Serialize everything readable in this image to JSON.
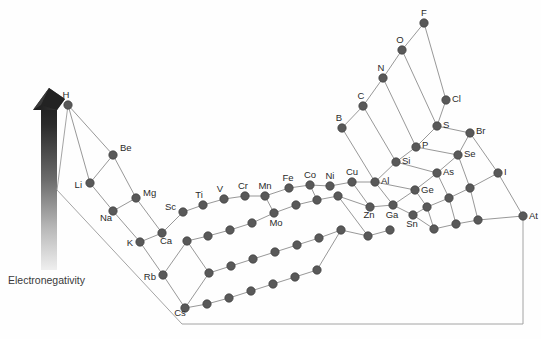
{
  "figure": {
    "axis_label": "Electronegativity",
    "arrow": {
      "name": "electronegativity-gradient-arrow",
      "direction": "up",
      "top_color": "#2a2a2a",
      "bottom_color": "#e8e8e8"
    },
    "colors": {
      "node_fill": "#595959",
      "node_stroke": "#3d3d3d",
      "edge": "#8c8c8c",
      "baseline": "#9a9a9a",
      "text": "#2b2b2b"
    }
  },
  "chart_data": {
    "type": "scatter",
    "title": "Electronegativity",
    "xlabel": "",
    "ylabel": "Electronegativity",
    "grid": false,
    "legend": false,
    "nodes": [
      {
        "label": "H",
        "x": 68,
        "y": 105,
        "lx": 66,
        "ly": 98,
        "anchor": "middle"
      },
      {
        "label": "Be",
        "x": 113,
        "y": 155,
        "lx": 120,
        "ly": 151,
        "anchor": "start"
      },
      {
        "label": "Li",
        "x": 90,
        "y": 183,
        "lx": 82,
        "ly": 188,
        "anchor": "end"
      },
      {
        "label": "Mg",
        "x": 136,
        "y": 198,
        "lx": 143,
        "ly": 196,
        "anchor": "start"
      },
      {
        "label": "Na",
        "x": 113,
        "y": 211,
        "lx": 106,
        "ly": 221,
        "anchor": "middle"
      },
      {
        "label": "Ca",
        "x": 162,
        "y": 233,
        "lx": 166,
        "ly": 244,
        "anchor": "middle"
      },
      {
        "label": "K",
        "x": 140,
        "y": 242,
        "lx": 133,
        "ly": 246,
        "anchor": "end"
      },
      {
        "label": "Rb",
        "x": 163,
        "y": 275,
        "lx": 156,
        "ly": 280,
        "anchor": "end"
      },
      {
        "label": "Cs",
        "x": 185,
        "y": 308,
        "lx": 180,
        "ly": 316,
        "anchor": "middle"
      },
      {
        "label": "Sc",
        "x": 183,
        "y": 212,
        "lx": 176,
        "ly": 210,
        "anchor": "end"
      },
      {
        "label": "Ti",
        "x": 203,
        "y": 205,
        "lx": 199,
        "ly": 198,
        "anchor": "middle"
      },
      {
        "label": "V",
        "x": 224,
        "y": 199,
        "lx": 220,
        "ly": 192,
        "anchor": "middle"
      },
      {
        "label": "Cr",
        "x": 245,
        "y": 196,
        "lx": 243,
        "ly": 189,
        "anchor": "middle"
      },
      {
        "label": "Mn",
        "x": 265,
        "y": 196,
        "lx": 265,
        "ly": 189,
        "anchor": "middle"
      },
      {
        "label": "Fe",
        "x": 289,
        "y": 188,
        "lx": 288,
        "ly": 181,
        "anchor": "middle"
      },
      {
        "label": "Co",
        "x": 310,
        "y": 185,
        "lx": 310,
        "ly": 178,
        "anchor": "middle"
      },
      {
        "label": "Ni",
        "x": 330,
        "y": 186,
        "lx": 330,
        "ly": 179,
        "anchor": "middle"
      },
      {
        "label": "Cu",
        "x": 352,
        "y": 182,
        "lx": 352,
        "ly": 175,
        "anchor": "middle"
      },
      {
        "label": "Zn",
        "x": 370,
        "y": 207,
        "lx": 369,
        "ly": 218,
        "anchor": "middle"
      },
      {
        "label": "Mo",
        "x": 274,
        "y": 213,
        "lx": 276,
        "ly": 226,
        "anchor": "middle"
      },
      {
        "label": "B",
        "x": 342,
        "y": 128,
        "lx": 339,
        "ly": 121,
        "anchor": "middle"
      },
      {
        "label": "C",
        "x": 363,
        "y": 106,
        "lx": 361,
        "ly": 99,
        "anchor": "middle"
      },
      {
        "label": "N",
        "x": 383,
        "y": 78,
        "lx": 381,
        "ly": 71,
        "anchor": "middle"
      },
      {
        "label": "O",
        "x": 402,
        "y": 50,
        "lx": 400,
        "ly": 43,
        "anchor": "middle"
      },
      {
        "label": "F",
        "x": 424,
        "y": 23,
        "lx": 424,
        "ly": 16,
        "anchor": "middle"
      },
      {
        "label": "Al",
        "x": 375,
        "y": 182,
        "lx": 381,
        "ly": 184,
        "anchor": "start"
      },
      {
        "label": "Si",
        "x": 396,
        "y": 162,
        "lx": 402,
        "ly": 164,
        "anchor": "start"
      },
      {
        "label": "P",
        "x": 416,
        "y": 147,
        "lx": 422,
        "ly": 148,
        "anchor": "start"
      },
      {
        "label": "S",
        "x": 437,
        "y": 126,
        "lx": 443,
        "ly": 128,
        "anchor": "start"
      },
      {
        "label": "Cl",
        "x": 446,
        "y": 100,
        "lx": 452,
        "ly": 102,
        "anchor": "start"
      },
      {
        "label": "Ga",
        "x": 393,
        "y": 205,
        "lx": 392,
        "ly": 218,
        "anchor": "middle"
      },
      {
        "label": "Ge",
        "x": 415,
        "y": 190,
        "lx": 421,
        "ly": 193,
        "anchor": "start"
      },
      {
        "label": "As",
        "x": 437,
        "y": 173,
        "lx": 443,
        "ly": 175,
        "anchor": "start"
      },
      {
        "label": "Se",
        "x": 458,
        "y": 155,
        "lx": 464,
        "ly": 157,
        "anchor": "start"
      },
      {
        "label": "Br",
        "x": 470,
        "y": 133,
        "lx": 476,
        "ly": 134,
        "anchor": "start"
      },
      {
        "label": "Sn",
        "x": 413,
        "y": 215,
        "lx": 412,
        "ly": 227,
        "anchor": "middle"
      },
      {
        "label": "I",
        "x": 498,
        "y": 173,
        "lx": 504,
        "ly": 175,
        "anchor": "start"
      },
      {
        "label": "At",
        "x": 523,
        "y": 216,
        "lx": 529,
        "ly": 219,
        "anchor": "start"
      },
      {
        "label": "",
        "x": 187,
        "y": 241,
        "lx": 0,
        "ly": 0,
        "anchor": "middle"
      },
      {
        "label": "",
        "x": 208,
        "y": 236,
        "lx": 0,
        "ly": 0,
        "anchor": "middle"
      },
      {
        "label": "",
        "x": 230,
        "y": 230,
        "lx": 0,
        "ly": 0,
        "anchor": "middle"
      },
      {
        "label": "",
        "x": 252,
        "y": 223,
        "lx": 0,
        "ly": 0,
        "anchor": "middle"
      },
      {
        "label": "",
        "x": 296,
        "y": 205,
        "lx": 0,
        "ly": 0,
        "anchor": "middle"
      },
      {
        "label": "",
        "x": 317,
        "y": 200,
        "lx": 0,
        "ly": 0,
        "anchor": "middle"
      },
      {
        "label": "",
        "x": 338,
        "y": 196,
        "lx": 0,
        "ly": 0,
        "anchor": "middle"
      },
      {
        "label": "",
        "x": 209,
        "y": 273,
        "lx": 0,
        "ly": 0,
        "anchor": "middle"
      },
      {
        "label": "",
        "x": 231,
        "y": 266,
        "lx": 0,
        "ly": 0,
        "anchor": "middle"
      },
      {
        "label": "",
        "x": 253,
        "y": 259,
        "lx": 0,
        "ly": 0,
        "anchor": "middle"
      },
      {
        "label": "",
        "x": 275,
        "y": 252,
        "lx": 0,
        "ly": 0,
        "anchor": "middle"
      },
      {
        "label": "",
        "x": 297,
        "y": 245,
        "lx": 0,
        "ly": 0,
        "anchor": "middle"
      },
      {
        "label": "",
        "x": 319,
        "y": 238,
        "lx": 0,
        "ly": 0,
        "anchor": "middle"
      },
      {
        "label": "",
        "x": 341,
        "y": 230,
        "lx": 0,
        "ly": 0,
        "anchor": "middle"
      },
      {
        "label": "",
        "x": 207,
        "y": 304,
        "lx": 0,
        "ly": 0,
        "anchor": "middle"
      },
      {
        "label": "",
        "x": 229,
        "y": 298,
        "lx": 0,
        "ly": 0,
        "anchor": "middle"
      },
      {
        "label": "",
        "x": 251,
        "y": 291,
        "lx": 0,
        "ly": 0,
        "anchor": "middle"
      },
      {
        "label": "",
        "x": 273,
        "y": 284,
        "lx": 0,
        "ly": 0,
        "anchor": "middle"
      },
      {
        "label": "",
        "x": 295,
        "y": 277,
        "lx": 0,
        "ly": 0,
        "anchor": "middle"
      },
      {
        "label": "",
        "x": 317,
        "y": 270,
        "lx": 0,
        "ly": 0,
        "anchor": "middle"
      },
      {
        "label": "",
        "x": 427,
        "y": 207,
        "lx": 0,
        "ly": 0,
        "anchor": "middle"
      },
      {
        "label": "",
        "x": 449,
        "y": 198,
        "lx": 0,
        "ly": 0,
        "anchor": "middle"
      },
      {
        "label": "",
        "x": 470,
        "y": 188,
        "lx": 0,
        "ly": 0,
        "anchor": "middle"
      },
      {
        "label": "",
        "x": 434,
        "y": 229,
        "lx": 0,
        "ly": 0,
        "anchor": "middle"
      },
      {
        "label": "",
        "x": 456,
        "y": 224,
        "lx": 0,
        "ly": 0,
        "anchor": "middle"
      },
      {
        "label": "",
        "x": 478,
        "y": 220,
        "lx": 0,
        "ly": 0,
        "anchor": "middle"
      },
      {
        "label": "",
        "x": 390,
        "y": 230,
        "lx": 0,
        "ly": 0,
        "anchor": "middle"
      },
      {
        "label": "",
        "x": 368,
        "y": 236,
        "lx": 0,
        "ly": 0,
        "anchor": "middle"
      }
    ],
    "edges": [
      [
        68,
        105,
        90,
        183
      ],
      [
        68,
        105,
        113,
        155
      ],
      [
        113,
        155,
        90,
        183
      ],
      [
        113,
        155,
        136,
        198
      ],
      [
        90,
        183,
        113,
        211
      ],
      [
        113,
        211,
        136,
        198
      ],
      [
        113,
        211,
        140,
        242
      ],
      [
        136,
        198,
        162,
        233
      ],
      [
        140,
        242,
        162,
        233
      ],
      [
        140,
        242,
        163,
        275
      ],
      [
        163,
        275,
        185,
        308
      ],
      [
        163,
        275,
        187,
        241
      ],
      [
        185,
        308,
        207,
        304
      ],
      [
        162,
        233,
        183,
        212
      ],
      [
        183,
        212,
        203,
        205
      ],
      [
        203,
        205,
        224,
        199
      ],
      [
        224,
        199,
        245,
        196
      ],
      [
        245,
        196,
        265,
        196
      ],
      [
        265,
        196,
        289,
        188
      ],
      [
        289,
        188,
        310,
        185
      ],
      [
        310,
        185,
        330,
        186
      ],
      [
        330,
        186,
        352,
        182
      ],
      [
        352,
        182,
        375,
        182
      ],
      [
        352,
        182,
        370,
        207
      ],
      [
        370,
        207,
        393,
        205
      ],
      [
        375,
        182,
        393,
        205
      ],
      [
        375,
        182,
        396,
        162
      ],
      [
        396,
        162,
        416,
        147
      ],
      [
        416,
        147,
        437,
        126
      ],
      [
        437,
        126,
        446,
        100
      ],
      [
        342,
        128,
        363,
        106
      ],
      [
        363,
        106,
        383,
        78
      ],
      [
        383,
        78,
        402,
        50
      ],
      [
        402,
        50,
        424,
        23
      ],
      [
        342,
        128,
        375,
        182
      ],
      [
        363,
        106,
        396,
        162
      ],
      [
        383,
        78,
        416,
        147
      ],
      [
        402,
        50,
        437,
        126
      ],
      [
        424,
        23,
        446,
        100
      ],
      [
        393,
        205,
        415,
        190
      ],
      [
        415,
        190,
        437,
        173
      ],
      [
        437,
        173,
        458,
        155
      ],
      [
        458,
        155,
        470,
        133
      ],
      [
        375,
        182,
        415,
        190
      ],
      [
        396,
        162,
        437,
        173
      ],
      [
        416,
        147,
        458,
        155
      ],
      [
        437,
        126,
        470,
        133
      ],
      [
        393,
        205,
        413,
        215
      ],
      [
        413,
        215,
        427,
        207
      ],
      [
        427,
        207,
        449,
        198
      ],
      [
        449,
        198,
        470,
        188
      ],
      [
        470,
        188,
        498,
        173
      ],
      [
        415,
        190,
        427,
        207
      ],
      [
        437,
        173,
        449,
        198
      ],
      [
        458,
        155,
        470,
        188
      ],
      [
        470,
        133,
        498,
        173
      ],
      [
        413,
        215,
        434,
        229
      ],
      [
        434,
        229,
        456,
        224
      ],
      [
        456,
        224,
        478,
        220
      ],
      [
        478,
        220,
        523,
        216
      ],
      [
        498,
        173,
        523,
        216
      ],
      [
        427,
        207,
        434,
        229
      ],
      [
        449,
        198,
        456,
        224
      ],
      [
        470,
        188,
        478,
        220
      ],
      [
        187,
        241,
        208,
        236
      ],
      [
        208,
        236,
        230,
        230
      ],
      [
        230,
        230,
        252,
        223
      ],
      [
        252,
        223,
        274,
        213
      ],
      [
        274,
        213,
        296,
        205
      ],
      [
        296,
        205,
        317,
        200
      ],
      [
        317,
        200,
        338,
        196
      ],
      [
        338,
        196,
        368,
        236
      ],
      [
        368,
        236,
        390,
        230
      ],
      [
        338,
        196,
        370,
        207
      ],
      [
        265,
        196,
        274,
        213
      ],
      [
        310,
        185,
        317,
        200
      ],
      [
        187,
        241,
        209,
        273
      ],
      [
        209,
        273,
        231,
        266
      ],
      [
        231,
        266,
        253,
        259
      ],
      [
        253,
        259,
        275,
        252
      ],
      [
        275,
        252,
        297,
        245
      ],
      [
        297,
        245,
        319,
        238
      ],
      [
        319,
        238,
        341,
        230
      ],
      [
        341,
        230,
        368,
        236
      ],
      [
        207,
        304,
        229,
        298
      ],
      [
        229,
        298,
        251,
        291
      ],
      [
        251,
        291,
        273,
        284
      ],
      [
        273,
        284,
        295,
        277
      ],
      [
        295,
        277,
        317,
        270
      ],
      [
        317,
        270,
        341,
        230
      ],
      [
        185,
        308,
        209,
        273
      ]
    ],
    "baseline": [
      [
        68,
        105,
        57,
        190
      ],
      [
        57,
        190,
        182,
        324
      ],
      [
        182,
        324,
        523,
        324
      ],
      [
        523,
        216,
        523,
        324
      ]
    ]
  }
}
